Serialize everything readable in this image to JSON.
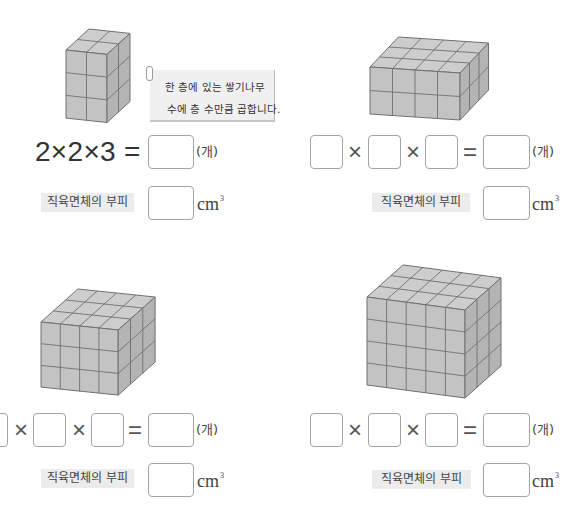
{
  "cube_colors": {
    "top": "#cdcdcd",
    "front": "#c3c3c3",
    "side": "#b4b4b4",
    "edge": "#707070"
  },
  "problems": [
    {
      "cuboid": {
        "width_cubes": 2,
        "depth_cubes": 2,
        "height_cubes": 3
      },
      "hint_note": {
        "line1": "한 층에 있는 쌓기나무",
        "line2": "수에 층 수만큼 곱합니다."
      },
      "equation": {
        "expression": "2×2×3 =",
        "result_value": "",
        "unit": "(개)"
      },
      "volume": {
        "label": "직육면체의 부피",
        "value": "",
        "unit": "cm",
        "unit_exponent": "3"
      }
    },
    {
      "cuboid": {
        "width_cubes": 4,
        "depth_cubes": 3,
        "height_cubes": 2
      },
      "equation": {
        "factors": [
          "",
          "",
          ""
        ],
        "times": "×",
        "equals": "=",
        "result_value": "",
        "unit": "(개)"
      },
      "volume": {
        "label": "직육면체의 부피",
        "value": "",
        "unit": "cm",
        "unit_exponent": "3"
      }
    },
    {
      "cuboid": {
        "width_cubes": 4,
        "depth_cubes": 3,
        "height_cubes": 3
      },
      "equation": {
        "factors": [
          "",
          "",
          ""
        ],
        "times": "×",
        "equals": "=",
        "result_value": "",
        "unit": "(개)"
      },
      "volume": {
        "label": "직육면체의 부피",
        "value": "",
        "unit": "cm",
        "unit_exponent": "3"
      }
    },
    {
      "cuboid": {
        "width_cubes": 5,
        "depth_cubes": 3,
        "height_cubes": 4
      },
      "equation": {
        "factors": [
          "",
          "",
          ""
        ],
        "times": "×",
        "equals": "=",
        "result_value": "",
        "unit": "(개)"
      },
      "volume": {
        "label": "직육면체의 부피",
        "value": "",
        "unit": "cm",
        "unit_exponent": "3"
      }
    }
  ]
}
